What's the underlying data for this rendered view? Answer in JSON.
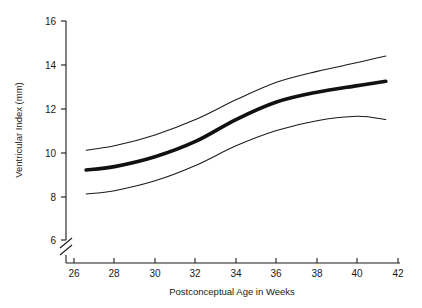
{
  "chart_data": {
    "type": "line",
    "title": "",
    "xlabel": "Postconceptual Age in Weeks",
    "ylabel": "Ventricular Index (mm)",
    "xlim": [
      25.0,
      42.6
    ],
    "ylim": [
      6,
      16
    ],
    "xticks": [
      26,
      28,
      30,
      32,
      34,
      36,
      38,
      40,
      42
    ],
    "yticks": [
      6,
      8,
      10,
      12,
      14,
      16
    ],
    "grid": false,
    "legend": "none",
    "axis_break": {
      "axis": "y",
      "below": 6,
      "style": "double-slash"
    },
    "x": [
      26.6,
      28,
      30,
      32,
      34,
      36,
      38,
      40,
      41.4
    ],
    "series": [
      {
        "name": "upper-band",
        "style": "thin",
        "values": [
          10.1,
          10.3,
          10.8,
          11.5,
          12.4,
          13.2,
          13.7,
          14.1,
          14.4
        ]
      },
      {
        "name": "mean",
        "style": "thick",
        "values": [
          9.2,
          9.35,
          9.8,
          10.5,
          11.5,
          12.3,
          12.75,
          13.05,
          13.25
        ]
      },
      {
        "name": "lower-band",
        "style": "thin",
        "values": [
          8.1,
          8.25,
          8.7,
          9.4,
          10.3,
          11.0,
          11.45,
          11.65,
          11.5
        ]
      }
    ]
  },
  "axes": {
    "x_title": "Postconceptual Age in Weeks",
    "y_title": "Ventricular Index (mm)",
    "x_tick_labels": [
      "26",
      "28",
      "30",
      "32",
      "34",
      "36",
      "38",
      "40",
      "42"
    ],
    "y_tick_labels": [
      "6",
      "8",
      "10",
      "12",
      "14",
      "16"
    ]
  }
}
